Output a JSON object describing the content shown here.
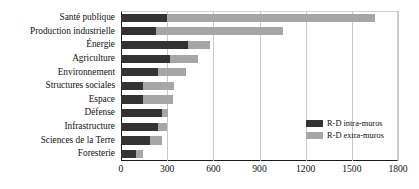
{
  "chart_data": {
    "type": "bar",
    "orientation": "horizontal",
    "stacked": true,
    "title": "",
    "subtitle": "",
    "xlabel": "",
    "ylabel": "",
    "xlim": [
      0,
      1800
    ],
    "xticks": [
      0,
      300,
      600,
      900,
      1200,
      1500,
      1800
    ],
    "xtick_labels": [
      "0",
      "300",
      "600",
      "900",
      "1200",
      "1500",
      "1800"
    ],
    "grid": true,
    "grid_axis": "x",
    "legend_position": "lower-right-inside",
    "categories": [
      "Santé publique",
      "Production industrielle",
      "Énergie",
      "Agriculture",
      "Environnement",
      "Structures sociales",
      "Espace",
      "Défense",
      "Infrastructure",
      "Sciences de la Terre",
      "Foresterie"
    ],
    "series": [
      {
        "name": "R-D intra-muros",
        "color": "#333333",
        "values": [
          300,
          230,
          435,
          320,
          240,
          140,
          140,
          265,
          240,
          190,
          95
        ]
      },
      {
        "name": "R-D extra-muros",
        "color": "#a6a6a6",
        "values": [
          1350,
          820,
          145,
          180,
          180,
          205,
          200,
          40,
          60,
          75,
          50
        ]
      }
    ],
    "totals": [
      1650,
      1050,
      580,
      500,
      420,
      345,
      340,
      305,
      300,
      265,
      145
    ]
  },
  "legend": {
    "entries": [
      {
        "label": "R-D intra-muros",
        "color": "#333333"
      },
      {
        "label": "R-D extra-muros",
        "color": "#a6a6a6"
      }
    ]
  },
  "colors": {
    "intra": "#333333",
    "extra": "#a6a6a6",
    "axis": "#1a1a1a",
    "grid": "#c8c8c8",
    "background": "#ffffff",
    "text": "#111111"
  }
}
